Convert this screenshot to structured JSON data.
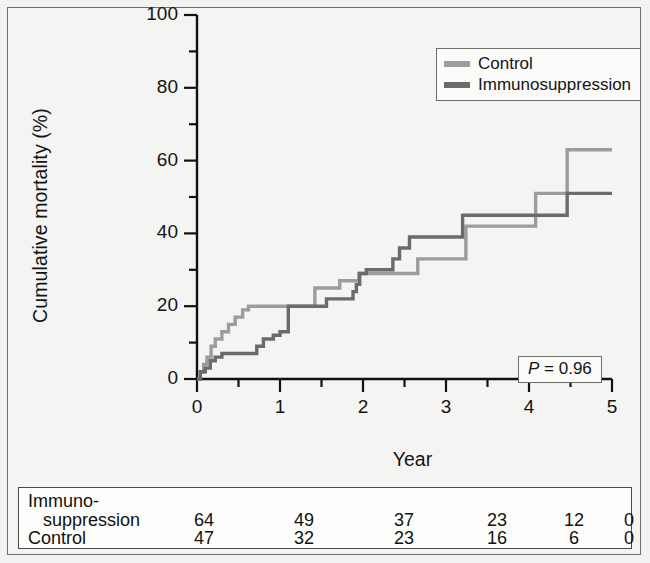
{
  "chart_data": {
    "type": "line",
    "subtype": "kaplan-meier-cumulative-incidence",
    "title": "",
    "xlabel": "Year",
    "ylabel": "Cumulative mortality (%)",
    "xlim": [
      0,
      5
    ],
    "ylim": [
      0,
      100
    ],
    "xticks": [
      0,
      1,
      2,
      3,
      4,
      5
    ],
    "xtick_labels": [
      "0",
      "1",
      "2",
      "3",
      "4",
      "5"
    ],
    "xminor_ticks": [
      0.5,
      1.5,
      2.5,
      3.5,
      4.5
    ],
    "yticks": [
      0,
      20,
      40,
      60,
      80,
      100
    ],
    "ytick_labels": [
      "0",
      "20",
      "40",
      "60",
      "80",
      "100"
    ],
    "yminor_ticks": [
      10,
      30,
      50,
      70,
      90
    ],
    "grid": false,
    "legend_position": "top-right",
    "annotation": {
      "text": "P = 0.96",
      "p_symbol": "P",
      "p_rest": " = 0.96",
      "position": "bottom-right"
    },
    "series": [
      {
        "name": "Control",
        "color": "#9c9c9c",
        "step_x": [
          0,
          0.04,
          0.08,
          0.12,
          0.17,
          0.22,
          0.3,
          0.38,
          0.46,
          0.55,
          0.62,
          1.32,
          1.42,
          1.62,
          1.72,
          1.88,
          1.95,
          2.58,
          2.66,
          3.16,
          3.24,
          4.0,
          4.08,
          4.4,
          4.46,
          5.0
        ],
        "step_y": [
          0,
          2,
          4,
          6,
          9,
          11,
          13,
          15,
          17,
          19,
          20,
          20,
          25,
          25,
          27,
          27,
          29,
          29,
          33,
          33,
          42,
          42,
          51,
          51,
          63,
          63
        ]
      },
      {
        "name": "Immunosuppression",
        "color": "#6b6b6b",
        "step_x": [
          0,
          0.04,
          0.1,
          0.16,
          0.22,
          0.3,
          0.64,
          0.72,
          0.8,
          0.92,
          1.0,
          1.1,
          1.48,
          1.56,
          1.8,
          1.88,
          1.92,
          1.96,
          2.04,
          2.28,
          2.36,
          2.44,
          2.56,
          3.12,
          3.2,
          4.4,
          4.46,
          5.0
        ],
        "step_y": [
          0,
          2,
          3,
          5,
          6,
          7,
          7,
          9,
          11,
          12,
          13,
          20,
          20,
          22,
          22,
          24,
          26,
          29,
          30,
          30,
          33,
          36,
          39,
          39,
          45,
          45,
          51,
          51
        ]
      }
    ]
  },
  "legend": {
    "items": [
      {
        "label": "Control",
        "color": "#9c9c9c"
      },
      {
        "label": "Immunosuppression",
        "color": "#6b6b6b"
      }
    ]
  },
  "pvalue": {
    "symbol": "P",
    "rest": " = 0.96",
    "full": "P = 0.96"
  },
  "risk_table": {
    "rows": [
      {
        "name_line1": "Immuno-",
        "name_line2": "suppression",
        "values": [
          "64",
          "49",
          "37",
          "23",
          "12",
          "0"
        ]
      },
      {
        "name_line1": "Control",
        "name_line2": "",
        "values": [
          "47",
          "32",
          "23",
          "16",
          "6",
          "0"
        ]
      }
    ]
  }
}
